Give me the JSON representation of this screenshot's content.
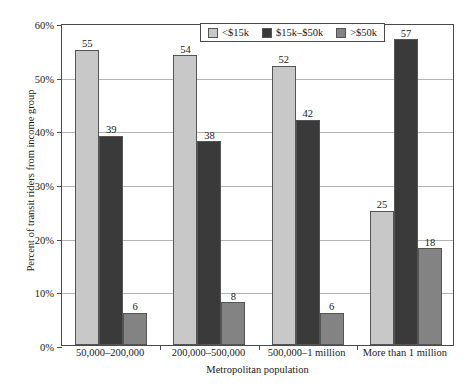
{
  "chart_data": {
    "type": "bar",
    "title": "",
    "xlabel": "Metropolitan population",
    "ylabel": "Percent of transit riders from income group",
    "categories": [
      "50,000–200,000",
      "200,000–500,000",
      "500,000–1 million",
      "More than 1 million"
    ],
    "series": [
      {
        "name": "<$15k",
        "color": "#c8c8c8",
        "values": [
          55,
          54,
          52,
          25
        ]
      },
      {
        "name": "$15k–$50k",
        "color": "#3a3a3a",
        "values": [
          39,
          38,
          42,
          57
        ]
      },
      {
        "name": ">$50k",
        "color": "#838383",
        "values": [
          6,
          8,
          6,
          18
        ]
      }
    ],
    "ylim": [
      0,
      60
    ],
    "ytick_values": [
      0,
      10,
      20,
      30,
      40,
      50,
      60
    ],
    "ytick_labels": [
      "0%",
      "10%",
      "20%",
      "30%",
      "40%",
      "50%",
      "60%"
    ],
    "grid": true,
    "legend_position": "top-center",
    "value_labels": true
  },
  "legend": {
    "items": [
      {
        "label": "<$15k",
        "color": "#c8c8c8"
      },
      {
        "label": "$15k–$50k",
        "color": "#3a3a3a"
      },
      {
        "label": ">$50k",
        "color": "#838383"
      }
    ]
  },
  "artifact": {
    "top_text": " "
  }
}
